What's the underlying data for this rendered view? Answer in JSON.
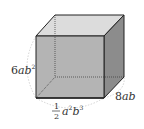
{
  "figure": {
    "type": "rectangular-prism",
    "labels": {
      "height": {
        "coef": "6",
        "vars": "ab",
        "sup": "2"
      },
      "depth": {
        "text": "8ab"
      },
      "width": {
        "frac_num": "1",
        "frac_den": "2",
        "a": "a",
        "a_sup": "2",
        "b": "b",
        "b_sup": "3"
      }
    },
    "colors": {
      "front": "#b4b4b4",
      "top": "#dcdcdc",
      "side": "#8c8c8c",
      "edge": "#222222",
      "arc": "#c8c8c8"
    }
  }
}
